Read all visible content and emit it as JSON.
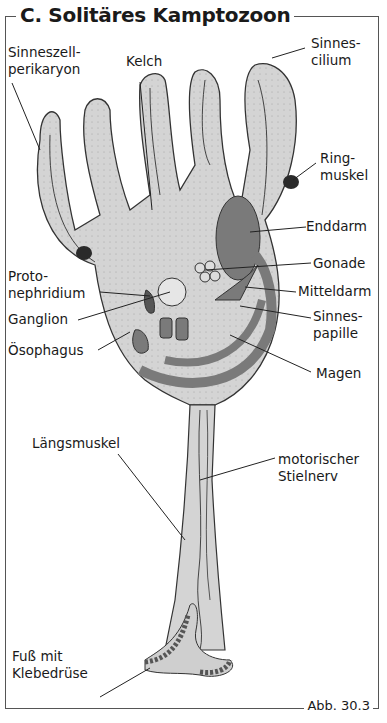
{
  "title": "C. Solitäres Kamptozoon",
  "figure_number": "Abb. 30.3",
  "colors": {
    "body_fill": "#d4d4d4",
    "organ_dark": "#7a7a7a",
    "organ_black": "#2a2a2a",
    "outline": "#333333",
    "frame": "#555555"
  },
  "labels": {
    "sinneszell": "Sinneszell-\nperikaryon",
    "kelch": "Kelch",
    "sinnescilium": "Sinnes-\ncilium",
    "ringmuskel": "Ring-\nmuskel",
    "enddarm": "Enddarm",
    "gonade": "Gonade",
    "protonephridium": "Proto-\nnephridium",
    "mitteldarm": "Mitteldarm",
    "ganglion": "Ganglion",
    "sinnespapille": "Sinnes-\npapille",
    "oesophagus": "Ösophagus",
    "magen": "Magen",
    "laengsmuskel": "Längsmuskel",
    "stielnerv": "motorischer\nStielnerv",
    "fuss": "Fuß mit\nKlebedrüse"
  }
}
